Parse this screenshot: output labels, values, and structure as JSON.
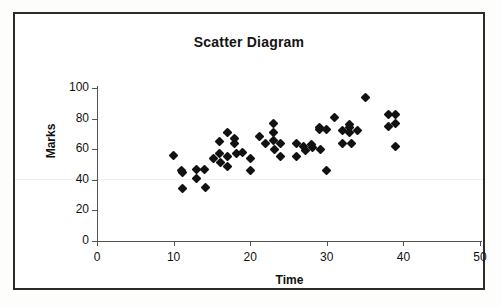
{
  "chart_data": {
    "type": "scatter",
    "title": "Scatter Diagram",
    "xlabel": "Time",
    "ylabel": "Marks",
    "xlim": [
      0,
      50
    ],
    "ylim": [
      0,
      100
    ],
    "xticks": [
      0,
      10,
      20,
      30,
      40,
      50
    ],
    "yticks": [
      0,
      20,
      40,
      60,
      80,
      100
    ],
    "grid": false,
    "legend": false,
    "marker": "diamond",
    "marker_color": "#121212",
    "series": [
      {
        "name": "Marks vs Time",
        "points": [
          [
            10.0,
            56
          ],
          [
            11.0,
            46
          ],
          [
            11.2,
            45
          ],
          [
            11.1,
            34
          ],
          [
            13.0,
            47
          ],
          [
            13.0,
            41
          ],
          [
            14.0,
            47
          ],
          [
            14.1,
            35
          ],
          [
            15.2,
            54
          ],
          [
            16.0,
            65
          ],
          [
            16.0,
            57
          ],
          [
            16.1,
            51
          ],
          [
            17.0,
            71
          ],
          [
            17.0,
            55
          ],
          [
            17.1,
            49
          ],
          [
            18.0,
            67
          ],
          [
            18.0,
            64
          ],
          [
            18.2,
            57
          ],
          [
            19.0,
            58
          ],
          [
            20.0,
            54
          ],
          [
            20.0,
            46
          ],
          [
            21.2,
            68
          ],
          [
            22.0,
            64
          ],
          [
            23.0,
            77
          ],
          [
            23.0,
            71
          ],
          [
            23.0,
            66
          ],
          [
            23.2,
            60
          ],
          [
            24.0,
            64
          ],
          [
            24.0,
            55
          ],
          [
            26.0,
            64
          ],
          [
            26.1,
            55
          ],
          [
            27.0,
            62
          ],
          [
            27.2,
            59
          ],
          [
            28.0,
            63
          ],
          [
            28.1,
            61
          ],
          [
            29.0,
            74
          ],
          [
            29.0,
            73
          ],
          [
            29.2,
            60
          ],
          [
            30.0,
            73
          ],
          [
            30.0,
            46
          ],
          [
            31.0,
            81
          ],
          [
            32.0,
            72
          ],
          [
            32.0,
            64
          ],
          [
            33.0,
            76
          ],
          [
            33.0,
            74
          ],
          [
            33.0,
            71
          ],
          [
            33.2,
            64
          ],
          [
            34.0,
            72
          ],
          [
            35.0,
            94
          ],
          [
            38.0,
            83
          ],
          [
            38.0,
            75
          ],
          [
            39.0,
            83
          ],
          [
            39.0,
            77
          ],
          [
            39.0,
            62
          ]
        ]
      }
    ]
  },
  "axes": {
    "x_tick_labels": [
      "0",
      "10",
      "20",
      "30",
      "40",
      "50"
    ],
    "y_tick_labels": [
      "0",
      "20",
      "40",
      "60",
      "80",
      "100"
    ]
  }
}
